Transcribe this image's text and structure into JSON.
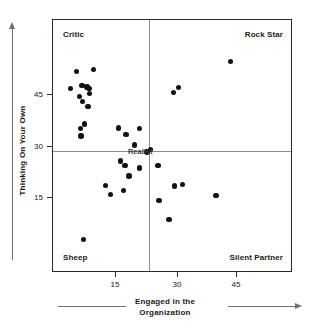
{
  "chart_data": {
    "type": "scatter",
    "title": "",
    "xlabel": "Engaged in the Organization",
    "ylabel": "Thinking On Your Own",
    "xlim": [
      6,
      66
    ],
    "ylim": [
      3,
      59
    ],
    "xticks": [
      15,
      30,
      45
    ],
    "yticks": [
      15,
      30,
      45
    ],
    "grid": false,
    "legend": null,
    "quadrant_divider_x": 30,
    "quadrant_divider_y": 30,
    "annotations": {
      "top_left": "Critic",
      "top_right": "Rock Star",
      "bottom_left": "Sheep",
      "bottom_right": "Silent Partner",
      "center": "Realist"
    },
    "points": [
      {
        "x": 11.8,
        "y": 47.6
      },
      {
        "x": 16.1,
        "y": 48.0
      },
      {
        "x": 10.4,
        "y": 43.8
      },
      {
        "x": 13.2,
        "y": 44.5
      },
      {
        "x": 14.5,
        "y": 44.2
      },
      {
        "x": 15.0,
        "y": 43.8
      },
      {
        "x": 15.1,
        "y": 42.8
      },
      {
        "x": 12.6,
        "y": 42.1
      },
      {
        "x": 13.3,
        "y": 41.0
      },
      {
        "x": 14.7,
        "y": 39.8
      },
      {
        "x": 13.8,
        "y": 36.0
      },
      {
        "x": 12.8,
        "y": 35.0
      },
      {
        "x": 13.0,
        "y": 33.3
      },
      {
        "x": 22.4,
        "y": 35.1
      },
      {
        "x": 27.6,
        "y": 35.0
      },
      {
        "x": 24.2,
        "y": 33.6
      },
      {
        "x": 26.3,
        "y": 31.3
      },
      {
        "x": 29.5,
        "y": 29.8
      },
      {
        "x": 30.4,
        "y": 30.4
      },
      {
        "x": 22.9,
        "y": 27.8
      },
      {
        "x": 24.0,
        "y": 26.8
      },
      {
        "x": 27.6,
        "y": 26.2
      },
      {
        "x": 32.2,
        "y": 26.8
      },
      {
        "x": 25.0,
        "y": 24.5
      },
      {
        "x": 19.1,
        "y": 22.4
      },
      {
        "x": 23.6,
        "y": 21.3
      },
      {
        "x": 20.3,
        "y": 20.4
      },
      {
        "x": 32.5,
        "y": 19.1
      },
      {
        "x": 36.4,
        "y": 22.3
      },
      {
        "x": 38.4,
        "y": 22.6
      },
      {
        "x": 46.7,
        "y": 20.2
      },
      {
        "x": 35.0,
        "y": 14.8
      },
      {
        "x": 13.6,
        "y": 10.4
      },
      {
        "x": 36.1,
        "y": 43.0
      },
      {
        "x": 37.3,
        "y": 44.0
      },
      {
        "x": 50.3,
        "y": 49.8
      }
    ]
  },
  "axes": {
    "y_tick_labels": [
      "45",
      "30",
      "15"
    ],
    "x_tick_labels": [
      "15",
      "30",
      "45"
    ]
  }
}
